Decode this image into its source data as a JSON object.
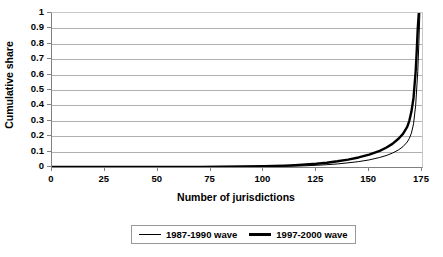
{
  "chart_data": {
    "type": "line",
    "title": "",
    "xlabel": "Number of jurisdictions",
    "ylabel": "Cumulative share",
    "xlim": [
      0,
      175
    ],
    "ylim": [
      0,
      1
    ],
    "xticks": [
      0,
      25,
      50,
      75,
      100,
      125,
      150,
      175
    ],
    "ytick_labels": [
      "1",
      "0.9",
      "0.8",
      "0.7",
      "0.6",
      "0.5",
      "0.4",
      "0.3",
      "0.2",
      "0.1",
      "0"
    ],
    "ytick_values": [
      1,
      0.9,
      0.8,
      0.7,
      0.6,
      0.5,
      0.4,
      0.3,
      0.2,
      0.1,
      0
    ],
    "grid": "horizontal",
    "legend_position": "bottom-center",
    "series": [
      {
        "name": "1987-1990 wave",
        "line_weight": "thin",
        "color": "#000000",
        "x": [
          0,
          10,
          20,
          30,
          40,
          50,
          60,
          70,
          80,
          90,
          100,
          105,
          110,
          115,
          120,
          125,
          130,
          135,
          140,
          145,
          150,
          155,
          158,
          161,
          164,
          166,
          168,
          169,
          170,
          171,
          172,
          173,
          173.5,
          174
        ],
        "y": [
          0,
          0,
          0,
          0,
          0,
          0,
          0,
          0,
          0,
          0.001,
          0.002,
          0.003,
          0.004,
          0.006,
          0.008,
          0.011,
          0.015,
          0.02,
          0.027,
          0.035,
          0.046,
          0.062,
          0.074,
          0.09,
          0.112,
          0.132,
          0.162,
          0.185,
          0.22,
          0.28,
          0.4,
          0.62,
          0.8,
          1.0
        ]
      },
      {
        "name": "1997-2000 wave",
        "line_weight": "thick",
        "color": "#000000",
        "x": [
          0,
          10,
          20,
          30,
          40,
          50,
          60,
          70,
          80,
          90,
          100,
          105,
          110,
          115,
          120,
          125,
          130,
          135,
          140,
          145,
          150,
          155,
          158,
          161,
          164,
          166,
          168,
          169,
          170,
          171,
          172,
          172.5,
          173,
          173.5
        ],
        "y": [
          0,
          0,
          0,
          0,
          0,
          0,
          0,
          0.001,
          0.002,
          0.003,
          0.005,
          0.007,
          0.009,
          0.012,
          0.016,
          0.021,
          0.028,
          0.037,
          0.048,
          0.062,
          0.08,
          0.105,
          0.125,
          0.15,
          0.185,
          0.215,
          0.26,
          0.3,
          0.36,
          0.45,
          0.62,
          0.75,
          0.9,
          1.0
        ]
      }
    ]
  },
  "legend": {
    "items": [
      {
        "label": "1987-1990 wave",
        "weight": "thin"
      },
      {
        "label": "1997-2000 wave",
        "weight": "thick"
      }
    ]
  }
}
